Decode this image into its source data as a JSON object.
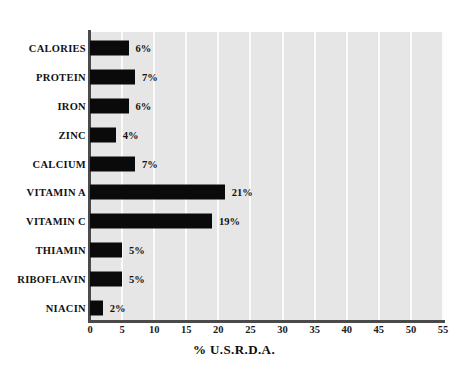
{
  "chart_data": {
    "type": "bar",
    "orientation": "horizontal",
    "title": "",
    "xlabel": "% U.S.R.D.A.",
    "ylabel": "",
    "xlim": [
      0,
      55
    ],
    "xticks": [
      0,
      5,
      10,
      15,
      20,
      25,
      30,
      35,
      40,
      45,
      50,
      55
    ],
    "xtick_labels": [
      "0",
      "5",
      "10",
      "15",
      "20",
      "25",
      "30",
      "35",
      "40",
      "45",
      "50",
      "55"
    ],
    "grid": true,
    "grid_axis": "x",
    "legend": null,
    "categories": [
      "CALORIES",
      "PROTEIN",
      "IRON",
      "ZINC",
      "CALCIUM",
      "VITAMIN A",
      "VITAMIN C",
      "THIAMIN",
      "RIBOFLAVIN",
      "NIACIN"
    ],
    "values": [
      6,
      7,
      6,
      4,
      7,
      21,
      19,
      5,
      5,
      2
    ],
    "data_labels": [
      "6%",
      "7%",
      "6%",
      "4%",
      "7%",
      "21%",
      "19%",
      "5%",
      "5%",
      "2%"
    ],
    "bars": [
      {
        "label": "CALORIES",
        "value": 6,
        "data_label": "6%"
      },
      {
        "label": "PROTEIN",
        "value": 7,
        "data_label": "7%"
      },
      {
        "label": "IRON",
        "value": 6,
        "data_label": "6%"
      },
      {
        "label": "ZINC",
        "value": 4,
        "data_label": "4%"
      },
      {
        "label": "CALCIUM",
        "value": 7,
        "data_label": "7%"
      },
      {
        "label": "VITAMIN A",
        "value": 21,
        "data_label": "21%"
      },
      {
        "label": "VITAMIN C",
        "value": 19,
        "data_label": "19%"
      },
      {
        "label": "THIAMIN",
        "value": 5,
        "data_label": "5%"
      },
      {
        "label": "RIBOFLAVIN",
        "value": 5,
        "data_label": "5%"
      },
      {
        "label": "NIACIN",
        "value": 2,
        "data_label": "2%"
      }
    ]
  },
  "colors": {
    "bar": "#0a0a0a",
    "plot_background": "#e6e6e6",
    "gridline": "#fbfbfb",
    "axis": "#4a4a4a",
    "text": "#111111",
    "page_background": "#ffffff"
  }
}
